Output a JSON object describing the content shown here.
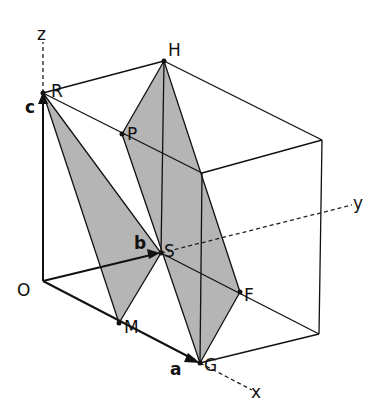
{
  "figure": {
    "axes": {
      "x": "x",
      "y": "y",
      "z": "z"
    },
    "origin": "O",
    "vectors": {
      "a": "a",
      "b": "b",
      "c": "c"
    },
    "points": {
      "R": "R",
      "H": "H",
      "P": "P",
      "S": "S",
      "F": "F",
      "G": "G",
      "M": "M"
    },
    "planes": [
      {
        "name": "plane-RSM",
        "vertices": [
          "R",
          "S",
          "M"
        ]
      },
      {
        "name": "plane-HPGF",
        "vertices": [
          "H",
          "P",
          "G",
          "F"
        ]
      }
    ],
    "colors": {
      "plane_fill": "#a8a8a8",
      "line": "#111111",
      "background": "#ffffff"
    }
  }
}
